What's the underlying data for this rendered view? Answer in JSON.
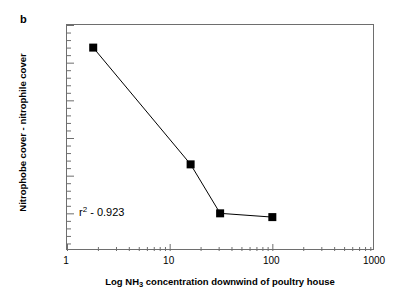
{
  "panel": {
    "label": "b"
  },
  "chart_data": {
    "type": "line",
    "title": "",
    "subtitle": "",
    "xlabel_parts": {
      "pre": "Log NH",
      "sub": "3",
      "post": " concentration downwind of poultry house"
    },
    "xlabel": "Log NH3 concentration downwind of poultry house",
    "ylabel": "Nitrophobe cover - nitrophile cover",
    "x_scale": "log",
    "y_scale": "linear",
    "xlim": [
      1,
      1000
    ],
    "ylim": [
      -60,
      0
    ],
    "x_tick_labels": [
      "1",
      "10",
      "100",
      "1000"
    ],
    "x_tick_values": [
      1,
      10,
      100,
      1000
    ],
    "y_tick_labels": [
      "0",
      "-10",
      "-20",
      "-30",
      "-40",
      "-50",
      "-60"
    ],
    "y_tick_values": [
      0,
      -10,
      -20,
      -30,
      -40,
      -50,
      -60
    ],
    "minor_ticks": true,
    "grid": false,
    "legend": null,
    "marker": "filled-square",
    "marker_color": "#000000",
    "line_color": "#000000",
    "series": [
      {
        "name": "Nitrophobe minus nitrophile cover",
        "x": [
          1.8,
          16,
          31,
          100
        ],
        "values": [
          -6,
          -37,
          -50,
          -51
        ]
      }
    ],
    "annotations": [
      {
        "text_parts": {
          "base": "r",
          "sup": "2",
          "rest": " - 0.923"
        },
        "text": "r2 - 0.923",
        "x": 1.3,
        "y": -51
      }
    ]
  }
}
